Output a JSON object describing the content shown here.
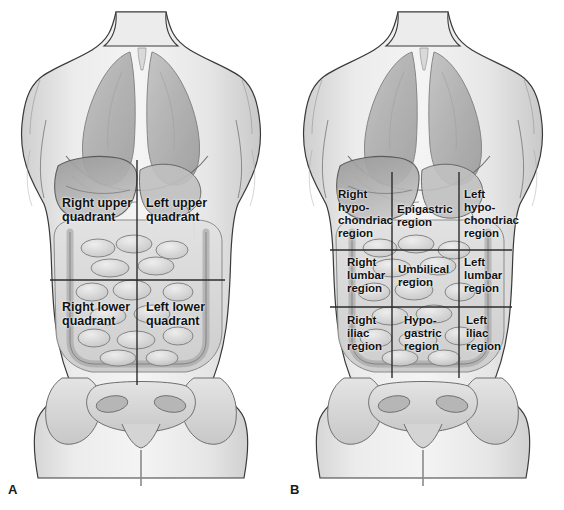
{
  "figure": {
    "background_color": "#ffffff",
    "line_color": "#2b2b2b",
    "text_color": "#111111",
    "body_fill": "#e8e8e8",
    "organ_fill": "#b4b4b4",
    "lung_fill": "#a8a8a8",
    "bone_fill": "#d8d8d8"
  },
  "panels": [
    {
      "letter": "A",
      "name": "abdominopelvic-quadrants",
      "scheme": "four-quadrants",
      "labels": [
        {
          "id": "right-upper-quadrant",
          "text": "Right upper\nquadrant",
          "x": 62,
          "y": 196,
          "align": "left"
        },
        {
          "id": "left-upper-quadrant",
          "text": "Left upper\nquadrant",
          "x": 146,
          "y": 196,
          "align": "left"
        },
        {
          "id": "right-lower-quadrant",
          "text": "Right lower\nquadrant",
          "x": 62,
          "y": 300,
          "align": "left"
        },
        {
          "id": "left-lower-quadrant",
          "text": "Left lower\nquadrant",
          "x": 146,
          "y": 300,
          "align": "left"
        }
      ],
      "grid": {
        "vertical_lines": [
          {
            "x": 137,
            "y1": 160,
            "y2": 385
          }
        ],
        "horizontal_lines": [
          {
            "y": 280,
            "x1": 50,
            "x2": 225
          }
        ]
      }
    },
    {
      "letter": "B",
      "name": "abdominopelvic-regions",
      "scheme": "nine-regions",
      "labels": [
        {
          "id": "right-hypochondriac-region",
          "text": "Right\nhypo-\nchondriac\nregion",
          "x": 338,
          "y": 188,
          "align": "left"
        },
        {
          "id": "epigastric-region",
          "text": "Epigastric\nregion",
          "x": 397,
          "y": 203,
          "align": "left"
        },
        {
          "id": "left-hypochondriac-region",
          "text": "Left\nhypo-\nchondriac\nregion",
          "x": 464,
          "y": 188,
          "align": "left"
        },
        {
          "id": "right-lumbar-region",
          "text": "Right\nlumbar\nregion",
          "x": 347,
          "y": 256,
          "align": "left"
        },
        {
          "id": "umbilical-region",
          "text": "Umbilical\nregion",
          "x": 398,
          "y": 263,
          "align": "left"
        },
        {
          "id": "left-lumbar-region",
          "text": "Left\nlumbar\nregion",
          "x": 464,
          "y": 256,
          "align": "left"
        },
        {
          "id": "right-iliac-region",
          "text": "Right\niliac\nregion",
          "x": 347,
          "y": 314,
          "align": "left"
        },
        {
          "id": "hypogastric-region",
          "text": "Hypo-\ngastric\nregion",
          "x": 404,
          "y": 314,
          "align": "left"
        },
        {
          "id": "left-iliac-region",
          "text": "Left\niliac\nregion",
          "x": 466,
          "y": 314,
          "align": "left"
        }
      ],
      "grid": {
        "vertical_lines": [
          {
            "x": 392,
            "y1": 172,
            "y2": 378
          },
          {
            "x": 459,
            "y1": 172,
            "y2": 378
          }
        ],
        "horizontal_lines": [
          {
            "y": 250,
            "x1": 330,
            "x2": 512
          },
          {
            "y": 307,
            "x1": 330,
            "x2": 512
          }
        ]
      }
    }
  ]
}
